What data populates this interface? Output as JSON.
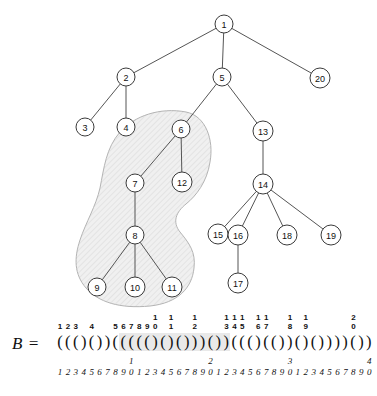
{
  "figure": {
    "caption_symbol": "B =",
    "bp_string": "((()())((((()()()))())((()(())()())))())",
    "highlight": {
      "start": 9,
      "end": 22
    },
    "nodes": [
      {
        "id": "1",
        "label": "1",
        "x": 224,
        "y": 24,
        "r": 9,
        "in_blob": false
      },
      {
        "id": "2",
        "label": "2",
        "x": 126,
        "y": 77,
        "r": 9,
        "in_blob": false
      },
      {
        "id": "5",
        "label": "5",
        "x": 222,
        "y": 77,
        "r": 9,
        "in_blob": false
      },
      {
        "id": "20",
        "label": "20",
        "x": 320,
        "y": 78,
        "r": 10,
        "in_blob": false
      },
      {
        "id": "3",
        "label": "3",
        "x": 85,
        "y": 127,
        "r": 9,
        "in_blob": false
      },
      {
        "id": "4",
        "label": "4",
        "x": 126,
        "y": 127,
        "r": 9,
        "in_blob": false
      },
      {
        "id": "6",
        "label": "6",
        "x": 181,
        "y": 129,
        "r": 9,
        "in_blob": true
      },
      {
        "id": "13",
        "label": "13",
        "x": 263,
        "y": 131,
        "r": 10,
        "in_blob": false
      },
      {
        "id": "7",
        "label": "7",
        "x": 135,
        "y": 183,
        "r": 9,
        "in_blob": true
      },
      {
        "id": "12",
        "label": "12",
        "x": 182,
        "y": 182,
        "r": 10,
        "in_blob": true
      },
      {
        "id": "14",
        "label": "14",
        "x": 263,
        "y": 184,
        "r": 10,
        "in_blob": false
      },
      {
        "id": "8",
        "label": "8",
        "x": 135,
        "y": 235,
        "r": 9,
        "in_blob": true
      },
      {
        "id": "15",
        "label": "15",
        "x": 218,
        "y": 234,
        "r": 10,
        "in_blob": false
      },
      {
        "id": "16",
        "label": "16",
        "x": 238,
        "y": 235,
        "r": 10,
        "in_blob": false
      },
      {
        "id": "18",
        "label": "18",
        "x": 287,
        "y": 235,
        "r": 10,
        "in_blob": false
      },
      {
        "id": "19",
        "label": "19",
        "x": 331,
        "y": 235,
        "r": 10,
        "in_blob": false
      },
      {
        "id": "9",
        "label": "9",
        "x": 97,
        "y": 287,
        "r": 9,
        "in_blob": true
      },
      {
        "id": "10",
        "label": "10",
        "x": 135,
        "y": 287,
        "r": 10,
        "in_blob": true
      },
      {
        "id": "11",
        "label": "11",
        "x": 172,
        "y": 287,
        "r": 10,
        "in_blob": true
      },
      {
        "id": "17",
        "label": "17",
        "x": 238,
        "y": 283,
        "r": 10,
        "in_blob": false
      }
    ],
    "edges": [
      [
        "1",
        "2"
      ],
      [
        "1",
        "5"
      ],
      [
        "1",
        "20"
      ],
      [
        "2",
        "3"
      ],
      [
        "2",
        "4"
      ],
      [
        "5",
        "6"
      ],
      [
        "5",
        "13"
      ],
      [
        "6",
        "7"
      ],
      [
        "6",
        "12"
      ],
      [
        "7",
        "8"
      ],
      [
        "8",
        "9"
      ],
      [
        "8",
        "10"
      ],
      [
        "8",
        "11"
      ],
      [
        "13",
        "14"
      ],
      [
        "14",
        "15"
      ],
      [
        "14",
        "16"
      ],
      [
        "14",
        "18"
      ],
      [
        "14",
        "19"
      ],
      [
        "16",
        "17"
      ]
    ],
    "blob_label": "shaded-subtree-region",
    "node_index_labels": [
      {
        "pos": 1,
        "text": "1"
      },
      {
        "pos": 2,
        "text": "2"
      },
      {
        "pos": 3,
        "text": "3"
      },
      {
        "pos": 5,
        "text": "4"
      },
      {
        "pos": 8,
        "text": "5"
      },
      {
        "pos": 9,
        "text": "6"
      },
      {
        "pos": 10,
        "text": "7"
      },
      {
        "pos": 11,
        "text": "8"
      },
      {
        "pos": 12,
        "text": "9"
      },
      {
        "pos": 13,
        "text": "10"
      },
      {
        "pos": 15,
        "text": "11"
      },
      {
        "pos": 18,
        "text": "12"
      },
      {
        "pos": 22,
        "text": "13"
      },
      {
        "pos": 23,
        "text": "14"
      },
      {
        "pos": 24,
        "text": "15"
      },
      {
        "pos": 26,
        "text": "16"
      },
      {
        "pos": 27,
        "text": "17"
      },
      {
        "pos": 30,
        "text": "18"
      },
      {
        "pos": 32,
        "text": "19"
      },
      {
        "pos": 38,
        "text": "20"
      }
    ],
    "position_ruler": {
      "units": "1234567890123456789012345678901234567890",
      "tens_marks": [
        {
          "pos": 10,
          "text": "1"
        },
        {
          "pos": 20,
          "text": "2"
        },
        {
          "pos": 30,
          "text": "3"
        },
        {
          "pos": 40,
          "text": "4"
        }
      ]
    }
  }
}
